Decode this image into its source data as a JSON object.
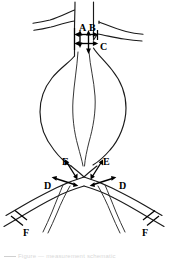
{
  "figure": {
    "background_color": "#ffffff",
    "line_color": "#1a1a1a",
    "label_color": "#000000",
    "width_px": 170,
    "height_px": 260
  },
  "labels": [
    {
      "id": "A",
      "text": "A",
      "meaning": "proximal-neck-diameter",
      "x": 79,
      "y": 23
    },
    {
      "id": "B",
      "text": "B",
      "meaning": "distal-neck-diameter",
      "x": 89,
      "y": 23
    },
    {
      "id": "C",
      "text": "C",
      "meaning": "neck-length",
      "x": 100,
      "y": 42
    },
    {
      "id": "D-left",
      "text": "D",
      "meaning": "iliac-artery-diameter-left",
      "x": 44,
      "y": 181
    },
    {
      "id": "D-right",
      "text": "D",
      "meaning": "iliac-artery-diameter-right",
      "x": 119,
      "y": 181
    },
    {
      "id": "E-left",
      "text": "E",
      "meaning": "common-iliac-length-left",
      "x": 62,
      "y": 157
    },
    {
      "id": "E-right",
      "text": "E",
      "meaning": "common-iliac-length-right",
      "x": 103,
      "y": 157
    },
    {
      "id": "F-left",
      "text": "F",
      "meaning": "external-iliac-diameter-left",
      "x": 23,
      "y": 228
    },
    {
      "id": "F-right",
      "text": "F",
      "meaning": "external-iliac-diameter-right",
      "x": 142,
      "y": 228
    }
  ],
  "measurements": [
    {
      "id": "A",
      "kind": "double-headed-arrow",
      "orientation": "vertical",
      "region": "proximal-neck"
    },
    {
      "id": "B",
      "kind": "double-headed-arrow",
      "orientation": "vertical",
      "region": "distal-neck"
    },
    {
      "id": "C",
      "kind": "double-headed-arrow",
      "orientation": "horizontal",
      "region": "neck-width"
    },
    {
      "id": "D",
      "kind": "double-headed-arrow",
      "orientation": "oblique",
      "region": "iliac-diameter"
    },
    {
      "id": "E",
      "kind": "double-headed-arrow",
      "orientation": "oblique",
      "region": "iliac-length"
    },
    {
      "id": "F",
      "kind": "tick-bracket",
      "orientation": "oblique",
      "region": "distal-iliac"
    }
  ],
  "caption": {
    "cropped_text": "Figure — measurement schematic",
    "visible": false
  }
}
